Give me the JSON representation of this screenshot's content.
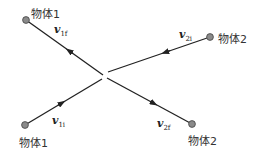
{
  "diagram": {
    "title": "",
    "objects": [
      {
        "id": "obj1_final",
        "label": "物体1",
        "dot": [
          26,
          20
        ]
      },
      {
        "id": "obj2_initial",
        "label": "物体2",
        "dot": [
          210,
          37
        ]
      },
      {
        "id": "obj1_initial",
        "label": "物体1",
        "dot": [
          25,
          125
        ]
      },
      {
        "id": "obj2_final",
        "label": "物体2",
        "dot": [
          192,
          124
        ]
      }
    ],
    "velocities": [
      {
        "id": "v1f",
        "symbol": "v",
        "subscript": "1f"
      },
      {
        "id": "v2i",
        "symbol": "v",
        "subscript": "2i"
      },
      {
        "id": "v1i",
        "symbol": "v",
        "subscript": "1i"
      },
      {
        "id": "v2f",
        "symbol": "v",
        "subscript": "2f"
      }
    ],
    "collision_point": [
      105,
      76
    ],
    "colors": {
      "line": "#222222",
      "dot_fill": "#8a8a8a",
      "dot_stroke": "#444444",
      "text": "#333333"
    }
  }
}
